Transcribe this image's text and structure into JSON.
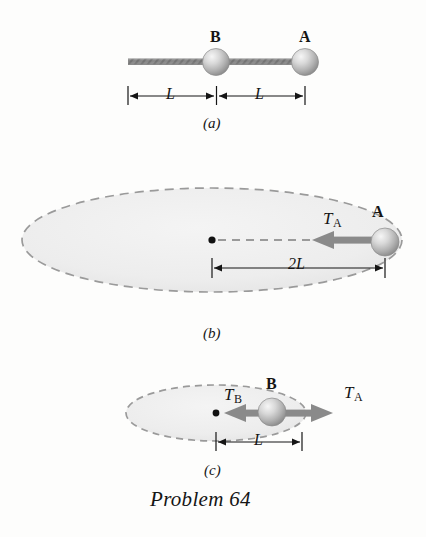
{
  "figure": {
    "caption": "Problem 64",
    "background_color": "#fdfdfc",
    "ink_color": "#151515",
    "arrow_color": "#8a8a8a",
    "ellipse_fill": "#eeeeee",
    "ellipse_dash_color": "#9a9a9a",
    "sphere_color_light": "#f2f2f2",
    "sphere_color_dark": "#999999",
    "cord_color": "#8d8d8d"
  },
  "panels": [
    {
      "id": "a",
      "label": "(a)",
      "description": "Two balls on a cord at rest",
      "balls": [
        {
          "name": "ball-b",
          "label": "B"
        },
        {
          "name": "ball-a",
          "label": "A"
        }
      ],
      "dimensions": [
        {
          "name": "dimension-left",
          "label": "L"
        },
        {
          "name": "dimension-right",
          "label": "L"
        }
      ]
    },
    {
      "id": "b",
      "label": "(b)",
      "description": "Ball A circling with tension T sub A toward center",
      "balls": [
        {
          "name": "ball-a",
          "label": "A"
        }
      ],
      "forces": [
        {
          "name": "force-ta",
          "base": "T",
          "sub": "A"
        }
      ],
      "dimensions": [
        {
          "name": "dimension-2l",
          "label": "2L"
        }
      ]
    },
    {
      "id": "c",
      "label": "(c)",
      "description": "Ball B circling with tension T sub B inward and T sub A outward",
      "balls": [
        {
          "name": "ball-b",
          "label": "B"
        }
      ],
      "forces": [
        {
          "name": "force-tb",
          "base": "T",
          "sub": "B"
        },
        {
          "name": "force-ta",
          "base": "T",
          "sub": "A"
        }
      ],
      "dimensions": [
        {
          "name": "dimension-l",
          "label": "L"
        }
      ]
    }
  ]
}
